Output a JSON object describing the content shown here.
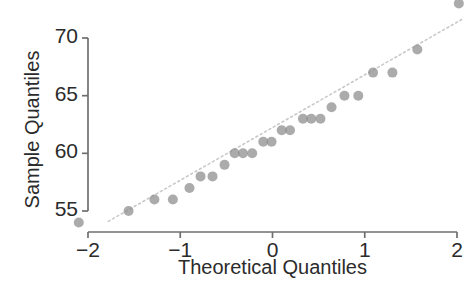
{
  "chart_data": {
    "type": "scatter",
    "title": "",
    "xlabel": "Theoretical Quantiles",
    "ylabel": "Sample Quantiles",
    "xlim": [
      -2.35,
      2.05
    ],
    "ylim": [
      53.0,
      73.5
    ],
    "xticks": [
      -2,
      -1,
      0,
      1,
      2
    ],
    "xticklabels": [
      "−2",
      "−1",
      "0",
      "1",
      "2"
    ],
    "yticks": [
      55,
      60,
      65,
      70
    ],
    "yticklabels": [
      "55",
      "60",
      "65",
      "70"
    ],
    "grid": false,
    "legend": null,
    "marker": {
      "shape": "circle",
      "color": "#8a8a8a",
      "size": 5
    },
    "reference_line": {
      "style": "dotted",
      "color": "#c9c9c9",
      "x": [
        -1.78,
        2.05
      ],
      "y": [
        54.1,
        71.6
      ]
    },
    "x": [
      -2.1,
      -1.56,
      -1.28,
      -1.08,
      -0.9,
      -0.78,
      -0.65,
      -0.52,
      -0.41,
      -0.32,
      -0.22,
      -0.1,
      -0.01,
      0.1,
      0.19,
      0.33,
      0.42,
      0.52,
      0.64,
      0.78,
      0.93,
      1.09,
      1.3,
      1.57,
      2.02
    ],
    "y": [
      54,
      55,
      56,
      56,
      57,
      58,
      58,
      59,
      60,
      60,
      60,
      61,
      61,
      62,
      62,
      63,
      63,
      63,
      64,
      65,
      65,
      67,
      67,
      69,
      73
    ],
    "n_points": 25,
    "points": [
      {
        "x": -2.1,
        "y": 54
      },
      {
        "x": -1.56,
        "y": 55
      },
      {
        "x": -1.28,
        "y": 56
      },
      {
        "x": -1.08,
        "y": 56
      },
      {
        "x": -0.9,
        "y": 57
      },
      {
        "x": -0.78,
        "y": 58
      },
      {
        "x": -0.65,
        "y": 58
      },
      {
        "x": -0.52,
        "y": 59
      },
      {
        "x": -0.41,
        "y": 60
      },
      {
        "x": -0.32,
        "y": 60
      },
      {
        "x": -0.22,
        "y": 60
      },
      {
        "x": -0.1,
        "y": 61
      },
      {
        "x": -0.01,
        "y": 61
      },
      {
        "x": 0.1,
        "y": 62
      },
      {
        "x": 0.19,
        "y": 62
      },
      {
        "x": 0.33,
        "y": 63
      },
      {
        "x": 0.42,
        "y": 63
      },
      {
        "x": 0.52,
        "y": 63
      },
      {
        "x": 0.64,
        "y": 64
      },
      {
        "x": 0.78,
        "y": 65
      },
      {
        "x": 0.93,
        "y": 65
      },
      {
        "x": 1.09,
        "y": 67
      },
      {
        "x": 1.3,
        "y": 67
      },
      {
        "x": 1.57,
        "y": 69
      },
      {
        "x": 2.02,
        "y": 73
      }
    ],
    "axis_color": "#6f6f6f"
  }
}
